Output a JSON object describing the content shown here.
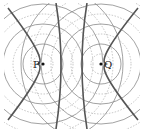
{
  "diagram": {
    "type": "two-source interference pattern (confocal hyperbolas)",
    "foci": [
      {
        "label": "P",
        "x": 43,
        "y": 64
      },
      {
        "label": "Q",
        "x": 101,
        "y": 64
      }
    ],
    "circle_radii": [
      10,
      20,
      30,
      40,
      50,
      60,
      70,
      80
    ],
    "circle_style_pattern": [
      "dashed",
      "solid"
    ],
    "colors": {
      "solid_circle": "#8a8a8a",
      "dashed_circle": "#b5b5b5",
      "hyperbola": "#555555",
      "dot": "#111111"
    }
  },
  "labels": {
    "p": "P",
    "q": "Q"
  }
}
